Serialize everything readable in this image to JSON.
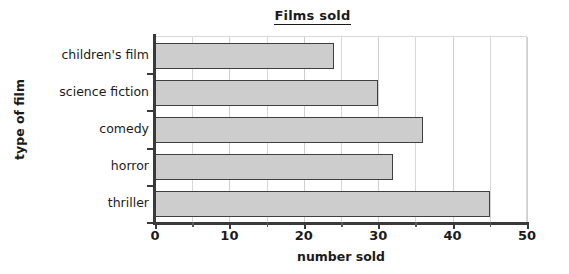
{
  "chart_data": {
    "type": "bar",
    "orientation": "horizontal",
    "title": "Films sold",
    "xlabel": "number sold",
    "ylabel": "type of film",
    "categories": [
      "children's film",
      "science fiction",
      "comedy",
      "horror",
      "thriller"
    ],
    "values": [
      24,
      30,
      36,
      32,
      45
    ],
    "xlim": [
      0,
      50
    ],
    "xticks": [
      0,
      10,
      20,
      30,
      40,
      50
    ],
    "xtick_labels": [
      "0",
      "10",
      "20",
      "30",
      "40",
      "50"
    ],
    "minor_tick_step": 5,
    "grid": "vertical-only",
    "legend": "none",
    "colors": {
      "bar_fill": "#cdcdcd",
      "bar_stroke": "#3f3f3f",
      "axis": "#3a3a3a",
      "gridline": "#d7d7d7",
      "text": "#1b1b1b",
      "background": "#ffffff"
    }
  }
}
